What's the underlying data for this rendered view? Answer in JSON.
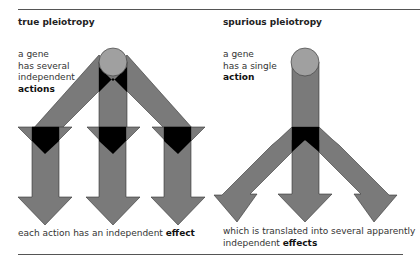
{
  "panels": {
    "left": {
      "title": "true pleiotropy",
      "gene_text": [
        "a gene",
        "has several",
        "independent"
      ],
      "gene_bold": "actions",
      "caption_plain": "each action has an independent ",
      "caption_bold": "effect"
    },
    "right": {
      "title": "spurious pleiotropy",
      "gene_text": [
        "a gene",
        "has a single"
      ],
      "gene_bold": "action",
      "caption_line1": "which is translated into several apparently",
      "caption_plain": "independent ",
      "caption_bold": "effects"
    }
  },
  "colors": {
    "arrow_fill": "#7a7a7a",
    "circle_fill": "#a0a0a0",
    "junction": "#000000",
    "rule": "#555555"
  }
}
